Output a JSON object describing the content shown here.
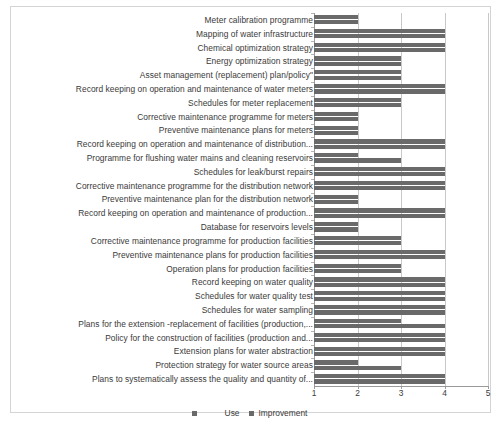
{
  "chart_data": {
    "type": "bar",
    "orientation": "horizontal",
    "title": "",
    "xlabel": "",
    "ylabel": "",
    "xlim": [
      1,
      5
    ],
    "xticks": [
      "1",
      "2",
      "3",
      "4",
      "5"
    ],
    "grid": true,
    "legend_position": "bottom",
    "colors": {
      "use": "#6a6a6a",
      "improvement": "#696969",
      "gridline": "#c8c8c8",
      "axis": "#9a9a9a",
      "border": "#d4d4d4",
      "text": "#3a3a3a"
    },
    "series": [
      {
        "name": "Use",
        "values": [
          2,
          4,
          4,
          3,
          3,
          4,
          3,
          2,
          2,
          4,
          2,
          4,
          4,
          2,
          4,
          2,
          3,
          4,
          3,
          4,
          4,
          4,
          3,
          4,
          4,
          2,
          4
        ]
      },
      {
        "name": "Improvement",
        "values": [
          2,
          4,
          4,
          3,
          3,
          4,
          3,
          2,
          2,
          4,
          3,
          4,
          4,
          2,
          4,
          2,
          3,
          4,
          3,
          4,
          4,
          4,
          4,
          4,
          4,
          3,
          4
        ]
      }
    ],
    "categories": [
      "Meter calibration programme",
      "Mapping of water infrastructure",
      "Chemical optimization strategy",
      "Energy optimization strategy",
      "Asset management (replacement) plan/policy\"",
      "Record keeping on operation and maintenance of water meters",
      "Schedules for meter replacement",
      "Corrective maintenance programme for meters",
      "Preventive maintenance plans for meters",
      "Record keeping on operation and maintenance of distribution...",
      "Programme for flushing water mains and cleaning reservoirs",
      "Schedules for leak/burst repairs",
      "Corrective maintenance programme for the distribution network",
      "Preventive  maintenance plan for the distribution network",
      "Record keeping on operation and maintenance of production...",
      "Database for reservoirs levels",
      "Corrective maintenance programme for  production facilities",
      "Preventive maintenance plans for production facilities",
      "Operation plans for production facilities",
      "Record keeping on water quality",
      "Schedules for water quality test",
      "Schedules for water sampling",
      "Plans for the extension -replacement of facilities (production,...",
      "Policy for the construction of facilities (production and...",
      "Extension plans for water abstraction",
      "Protection strategy for water source areas",
      "Plans to systematically assess the  quality and quantity of..."
    ]
  },
  "legend": {
    "entries": [
      {
        "label": "Use",
        "color": "#6a6a6a"
      },
      {
        "label": "Improvement",
        "color": "#696969"
      }
    ]
  }
}
